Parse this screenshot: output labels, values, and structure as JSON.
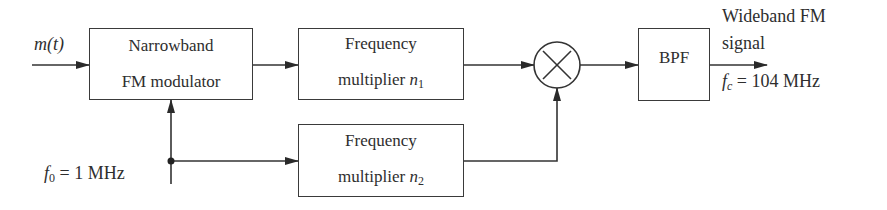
{
  "diagram": {
    "input": {
      "label": "m(t)"
    },
    "oscillator": {
      "label": "f",
      "sub": "0",
      "value": " = 1 MHz"
    },
    "blocks": [
      {
        "id": "nbfm",
        "line1": "Narrowband",
        "line2": "FM modulator"
      },
      {
        "id": "mult1",
        "line1": "Frequency",
        "line2": "multiplier ",
        "var": "n",
        "sub": "1"
      },
      {
        "id": "mult2",
        "line1": "Frequency",
        "line2": "multiplier ",
        "var": "n",
        "sub": "2"
      },
      {
        "id": "mixer",
        "symbol": "×"
      },
      {
        "id": "bpf",
        "line1": "BPF"
      }
    ],
    "output": {
      "line1": "Wideband FM",
      "line2": "signal",
      "freq_var": "f",
      "freq_sub": "c",
      "freq_value": " = 104 MHz"
    }
  }
}
